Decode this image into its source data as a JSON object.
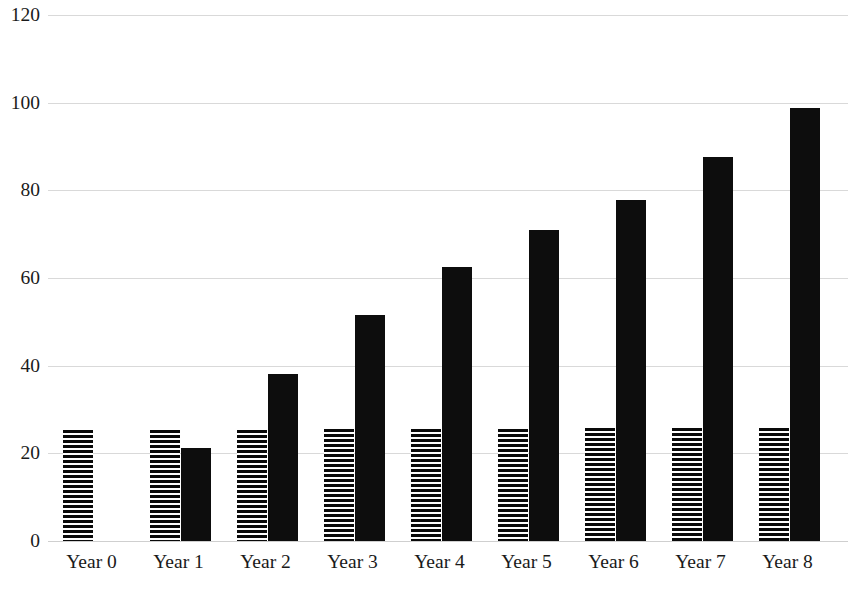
{
  "chart_data": {
    "type": "bar",
    "title": "",
    "subtitle": "",
    "xlabel": "",
    "ylabel": "",
    "ylim": [
      0,
      120
    ],
    "xlim_categories": 9,
    "grid": true,
    "grid_axis": "y",
    "legend": false,
    "legend_position": "none",
    "categories": [
      "Year 0",
      "Year 1",
      "Year 2",
      "Year 3",
      "Year 4",
      "Year 5",
      "Year 6",
      "Year 7",
      "Year 8"
    ],
    "y_ticks": [
      0,
      20,
      40,
      60,
      80,
      100,
      120
    ],
    "y_tick_labels": [
      "0",
      "20",
      "40",
      "60",
      "80",
      "100",
      "120"
    ],
    "series": [
      {
        "name": "series-striped",
        "style": "horizontal-hatch",
        "color": "#0a0a0a",
        "values": [
          25.3,
          25.3,
          25.4,
          25.5,
          25.6,
          25.6,
          25.8,
          25.7,
          25.8
        ]
      },
      {
        "name": "series-solid",
        "style": "solid",
        "color": "#0d0d0d",
        "values": [
          0,
          21.2,
          38.2,
          51.6,
          62.5,
          71.0,
          77.9,
          87.6,
          98.8
        ]
      }
    ]
  },
  "axes": {
    "y_axis_name": "y-axis",
    "x_axis_name": "x-axis"
  },
  "colors": {
    "background": "#ffffff",
    "gridline": "#d9d9d9",
    "bar_solid": "#0d0d0d",
    "bar_hatch": "#0a0a0a",
    "text": "#1a1a1a"
  }
}
